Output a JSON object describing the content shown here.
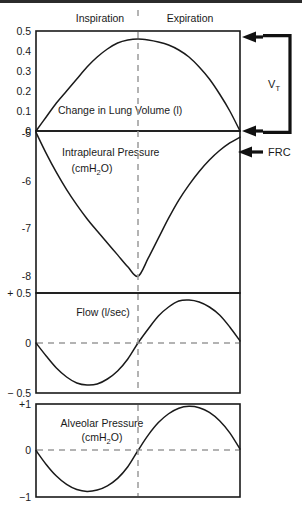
{
  "figure": {
    "title": "",
    "phases": {
      "inspiration": "Inspiration",
      "expiration": "Expiration"
    },
    "annotations": {
      "tidal_volume": "V",
      "tidal_volume_sub": "T",
      "frc": "FRC"
    },
    "colors": {
      "curve": "#1a1a1a",
      "frame": "#1a1a1a",
      "dashed": "#9b9b9b",
      "arrow": "#111111",
      "background": "#ffffff"
    }
  },
  "chart_data": [
    {
      "type": "line",
      "name": "lung-volume",
      "title": "Change in Lung Volume (l)",
      "xlabel": "",
      "ylabel": "Change in Lung Volume (l)",
      "ylim": [
        0,
        0.5
      ],
      "xlim": [
        0,
        1
      ],
      "grid": false,
      "yticks": [
        "0.5",
        "0.4",
        "0.3",
        "0.2",
        "0.1",
        "0"
      ],
      "ytickvalues": [
        0.5,
        0.4,
        0.3,
        0.2,
        0.1,
        0
      ],
      "zero_dashed": false,
      "x": [
        0,
        0.05,
        0.1,
        0.15,
        0.2,
        0.25,
        0.3,
        0.35,
        0.4,
        0.45,
        0.5,
        0.55,
        0.6,
        0.65,
        0.7,
        0.75,
        0.8,
        0.85,
        0.9,
        0.95,
        1
      ],
      "values": [
        0,
        0.07,
        0.14,
        0.2,
        0.26,
        0.32,
        0.37,
        0.41,
        0.44,
        0.455,
        0.46,
        0.455,
        0.445,
        0.43,
        0.405,
        0.37,
        0.32,
        0.26,
        0.185,
        0.1,
        0
      ]
    },
    {
      "type": "line",
      "name": "intrapleural-pressure",
      "title": "Intrapleural Pressure",
      "title_line2": "(cmH2O)",
      "title_sub": "2",
      "xlabel": "",
      "ylabel": "Intrapleural Pressure (cmH2O)",
      "ylim": [
        -8.35,
        -4.95
      ],
      "xlim": [
        0,
        1
      ],
      "grid": false,
      "yticks": [
        "-5",
        "-6",
        "-7",
        "-8"
      ],
      "ytickvalues": [
        -5,
        -6,
        -7,
        -8
      ],
      "zero_dashed": false,
      "x": [
        0,
        0.05,
        0.1,
        0.15,
        0.2,
        0.25,
        0.3,
        0.35,
        0.4,
        0.45,
        0.5,
        0.55,
        0.6,
        0.65,
        0.7,
        0.75,
        0.8,
        0.85,
        0.9,
        0.95,
        1
      ],
      "values": [
        -4.98,
        -5.42,
        -5.82,
        -6.18,
        -6.5,
        -6.79,
        -7.05,
        -7.3,
        -7.55,
        -7.8,
        -8.0,
        -7.62,
        -7.2,
        -6.78,
        -6.4,
        -6.08,
        -5.8,
        -5.56,
        -5.36,
        -5.2,
        -5.08
      ]
    },
    {
      "type": "line",
      "name": "flow",
      "title": "Flow (l/sec)",
      "xlabel": "",
      "ylabel": "Flow (l/sec)",
      "ylim": [
        -0.5,
        0.5
      ],
      "xlim": [
        0,
        1
      ],
      "grid": false,
      "yticks": [
        "+ 0.5",
        "0",
        "− 0.5"
      ],
      "ytickvalues": [
        0.5,
        0,
        -0.5
      ],
      "zero_dashed": true,
      "x": [
        0,
        0.05,
        0.1,
        0.15,
        0.2,
        0.25,
        0.3,
        0.35,
        0.4,
        0.45,
        0.5,
        0.55,
        0.6,
        0.65,
        0.7,
        0.75,
        0.8,
        0.85,
        0.9,
        0.95,
        1
      ],
      "values": [
        0,
        -0.13,
        -0.25,
        -0.34,
        -0.4,
        -0.42,
        -0.41,
        -0.36,
        -0.28,
        -0.16,
        0,
        0.14,
        0.27,
        0.36,
        0.42,
        0.43,
        0.41,
        0.36,
        0.28,
        0.16,
        0.02
      ]
    },
    {
      "type": "line",
      "name": "alveolar-pressure",
      "title": "Alveolar Pressure",
      "title_line2": "(cmH2O)",
      "title_sub": "2",
      "xlabel": "",
      "ylabel": "Alveolar Pressure (cmH2O)",
      "ylim": [
        -1,
        1
      ],
      "xlim": [
        0,
        1
      ],
      "grid": false,
      "yticks": [
        "+1",
        "0",
        "−1"
      ],
      "ytickvalues": [
        1,
        0,
        -1
      ],
      "zero_dashed": true,
      "x": [
        0,
        0.05,
        0.1,
        0.15,
        0.2,
        0.25,
        0.3,
        0.35,
        0.4,
        0.45,
        0.5,
        0.55,
        0.6,
        0.65,
        0.7,
        0.75,
        0.8,
        0.85,
        0.9,
        0.95,
        1
      ],
      "values": [
        0,
        -0.3,
        -0.55,
        -0.73,
        -0.84,
        -0.88,
        -0.85,
        -0.76,
        -0.6,
        -0.35,
        0,
        0.33,
        0.6,
        0.79,
        0.91,
        0.95,
        0.92,
        0.82,
        0.64,
        0.38,
        0.03
      ]
    }
  ]
}
